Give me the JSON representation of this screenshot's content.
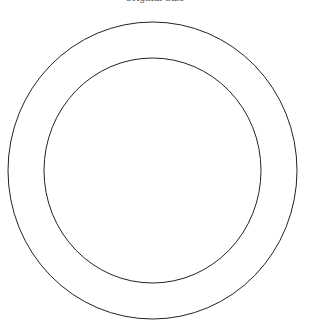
{
  "title": "Original Size",
  "colors": {
    "background": "#ffffff",
    "stroke": "#222222",
    "title": "#555555"
  },
  "shapes": {
    "outer_circle": {
      "cx": 152.5,
      "cy": 170.5,
      "rx": 144.5,
      "ry": 148.5
    },
    "inner_circle": {
      "cx": 152.5,
      "cy": 170.5,
      "rx": 108.5,
      "ry": 112.5
    }
  }
}
